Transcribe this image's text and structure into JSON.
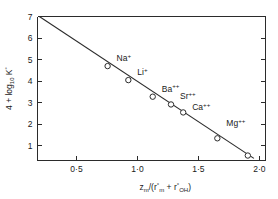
{
  "figure": {
    "background_color": "#ffffff",
    "ink_color": "#2b2b2b"
  },
  "chart_data": {
    "type": "scatter",
    "title": "",
    "subtitle": "",
    "xlabel": "z_m/(r°_m + r°_OH)",
    "xlabel_parts": {
      "z": "z",
      "z_sub": "m",
      "slash_open": "/(",
      "r1": "r",
      "r1_sup": "°",
      "r1_sub": "m",
      "plus": "+",
      "r2": "r",
      "r2_sup": "°",
      "r2_sub": "OH",
      "close": ")"
    },
    "ylabel": "4 + log₁₀ K°",
    "ylabel_parts": {
      "prefix": "4 + log",
      "sub": "10",
      "k": " K",
      "sup": "°"
    },
    "xlim": [
      0.18,
      2.05
    ],
    "ylim": [
      0.32,
      7.0
    ],
    "xticks": [
      0.5,
      1.0,
      1.5,
      2.0
    ],
    "xticklabels": [
      "0·5",
      "1·0",
      "1·5",
      "2·0"
    ],
    "yticks": [
      1,
      2,
      3,
      4,
      5,
      6,
      7
    ],
    "yticklabels": [
      "1",
      "2",
      "3",
      "4",
      "5",
      "6",
      "7"
    ],
    "grid": false,
    "legend": "none",
    "marker_style": "open-circle",
    "points": [
      {
        "label": "Na",
        "charge": "+",
        "x": 0.755,
        "y": 4.7,
        "label_dx": 9,
        "label_dy": -5
      },
      {
        "label": "Li",
        "charge": "+",
        "x": 0.925,
        "y": 4.05,
        "label_dx": 9,
        "label_dy": -5
      },
      {
        "label": "Ba",
        "charge": "++",
        "x": 1.125,
        "y": 3.28,
        "label_dx": 9,
        "label_dy": -5
      },
      {
        "label": "Sr",
        "charge": "++",
        "x": 1.275,
        "y": 2.92,
        "label_dx": 9,
        "label_dy": -5
      },
      {
        "label": "Ca",
        "charge": "++",
        "x": 1.375,
        "y": 2.55,
        "label_dx": 9,
        "label_dy": -2
      },
      {
        "label": "Mg",
        "charge": "++",
        "x": 1.655,
        "y": 1.35,
        "label_dx": 9,
        "label_dy": -12
      },
      {
        "label": "",
        "charge": "",
        "x": 1.905,
        "y": 0.55,
        "label_dx": 0,
        "label_dy": 0
      }
    ],
    "fit_line": {
      "x_start": 0.195,
      "y_start": 7.0,
      "x_end": 1.955,
      "y_end": 0.42
    }
  }
}
